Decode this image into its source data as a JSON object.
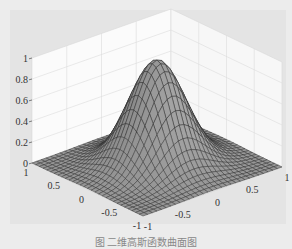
{
  "figure": {
    "caption": "图 二维高斯函数曲面图"
  },
  "chart_data": {
    "type": "surface3d",
    "title": "",
    "function": "z = exp(-(x^2 + y^2) / (2*sigma^2))",
    "peak_value": 1,
    "x_range": [
      -1,
      1
    ],
    "y_range": [
      -1,
      1
    ],
    "z_range": [
      0,
      1
    ],
    "x_ticks": [
      "-1",
      "-0.5",
      "0",
      "0.5",
      "1"
    ],
    "y_ticks": [
      "-1",
      "-0.5",
      "0",
      "0.5",
      "1"
    ],
    "z_ticks": [
      "0",
      "0.2",
      "0.4",
      "0.6",
      "0.8",
      "1"
    ],
    "grid": true,
    "mesh_color": "#2a2a2a",
    "surface_color": "#9a9a9a",
    "xlabel": "",
    "ylabel": "",
    "zlabel": ""
  }
}
